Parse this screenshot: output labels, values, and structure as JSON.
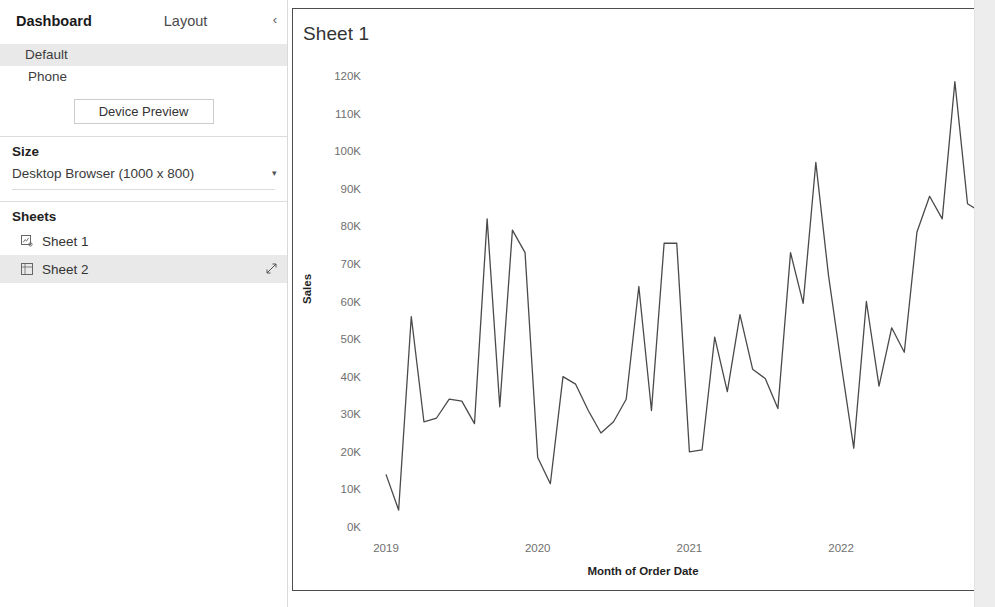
{
  "panel": {
    "tab_dashboard": "Dashboard",
    "tab_layout": "Layout",
    "collapse_icon": "chevron-left-icon",
    "devices": [
      {
        "label": "Default",
        "selected": true
      },
      {
        "label": "Phone",
        "selected": false
      }
    ],
    "device_preview_label": "Device Preview",
    "size": {
      "heading": "Size",
      "value": "Desktop Browser (1000 x 800)",
      "caret_icon": "caret-down-icon"
    },
    "sheets": {
      "heading": "Sheets",
      "items": [
        {
          "label": "Sheet 1",
          "icon": "chart-sheet-icon",
          "selected": false,
          "drag_icon": ""
        },
        {
          "label": "Sheet 2",
          "icon": "table-sheet-icon",
          "selected": true,
          "drag_icon": "drag-handle-icon"
        }
      ]
    }
  },
  "dashboard": {
    "viz_title": "Sheet 1"
  },
  "chart_data": {
    "type": "line",
    "title": "Sheet 1",
    "xlabel": "Month of Order Date",
    "ylabel": "Sales",
    "ylim": [
      0,
      120000
    ],
    "ytick_labels": [
      "120K",
      "110K",
      "100K",
      "90K",
      "80K",
      "70K",
      "60K",
      "50K",
      "40K",
      "30K",
      "20K",
      "10K",
      "0K"
    ],
    "ytick_values": [
      120000,
      110000,
      100000,
      90000,
      80000,
      70000,
      60000,
      50000,
      40000,
      30000,
      20000,
      10000,
      0
    ],
    "xtick_labels": [
      "2019",
      "2020",
      "2021",
      "2022",
      "2023"
    ],
    "xtick_values": [
      2019,
      2020,
      2021,
      2022,
      2023
    ],
    "grid": false,
    "legend": "none",
    "x": [
      "2019-01",
      "2019-02",
      "2019-03",
      "2019-04",
      "2019-05",
      "2019-06",
      "2019-07",
      "2019-08",
      "2019-09",
      "2019-10",
      "2019-11",
      "2019-12",
      "2020-01",
      "2020-02",
      "2020-03",
      "2020-04",
      "2020-05",
      "2020-06",
      "2020-07",
      "2020-08",
      "2020-09",
      "2020-10",
      "2020-11",
      "2020-12",
      "2021-01",
      "2021-02",
      "2021-03",
      "2021-04",
      "2021-05",
      "2021-06",
      "2021-07",
      "2021-08",
      "2021-09",
      "2021-10",
      "2021-11",
      "2021-12",
      "2022-01",
      "2022-02",
      "2022-03",
      "2022-04",
      "2022-05",
      "2022-06",
      "2022-07",
      "2022-08",
      "2022-09",
      "2022-10",
      "2022-11",
      "2022-12"
    ],
    "series": [
      {
        "name": "Sales",
        "values": [
          14000,
          4500,
          56000,
          28000,
          29000,
          34000,
          33500,
          27500,
          82000,
          32000,
          79000,
          73000,
          18500,
          11500,
          40000,
          38000,
          31000,
          25000,
          28000,
          34000,
          64000,
          31000,
          75500,
          75500,
          20000,
          20500,
          50500,
          36000,
          56500,
          42000,
          39500,
          31500,
          73000,
          59500,
          97000,
          67000,
          43500,
          21000,
          60000,
          37500,
          53000,
          46500,
          78500,
          88000,
          82000,
          118500,
          86000,
          84000
        ]
      }
    ]
  }
}
